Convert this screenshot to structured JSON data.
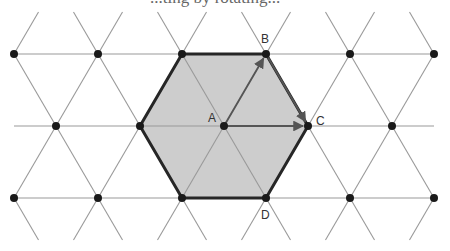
{
  "caption_fragment": "...ting by rotating...",
  "colors": {
    "lattice": "#9a9a9a",
    "hexagon_fill": "#cdcdcd",
    "hexagon_stroke": "#262626",
    "dot": "#1a1a1a",
    "arrow": "#555555",
    "label": "#333333"
  },
  "lattice": {
    "rows_y": [
      54,
      126,
      198
    ],
    "top_stub_y": 12,
    "bottom_stub_y": 240,
    "row_points_x": {
      "outer": [
        14,
        98,
        182,
        266,
        350,
        434
      ],
      "middle": [
        56,
        140,
        224,
        308,
        392
      ]
    }
  },
  "hexagon": {
    "vertices": [
      [
        182,
        54
      ],
      [
        266,
        54
      ],
      [
        308,
        126
      ],
      [
        266,
        198
      ],
      [
        182,
        198
      ],
      [
        140,
        126
      ]
    ]
  },
  "points": [
    {
      "name": "A",
      "x": 224,
      "y": 126,
      "label_x": 208,
      "label_y": 122
    },
    {
      "name": "B",
      "x": 266,
      "y": 54,
      "label_x": 261,
      "label_y": 43
    },
    {
      "name": "C",
      "x": 308,
      "y": 126,
      "label_x": 316,
      "label_y": 125
    },
    {
      "name": "D",
      "x": 266,
      "y": 198,
      "label_x": 261,
      "label_y": 219
    }
  ],
  "vectors": [
    {
      "from": "A",
      "to": "B"
    },
    {
      "from": "B",
      "to": "C"
    },
    {
      "from": "A",
      "to": "C"
    }
  ]
}
